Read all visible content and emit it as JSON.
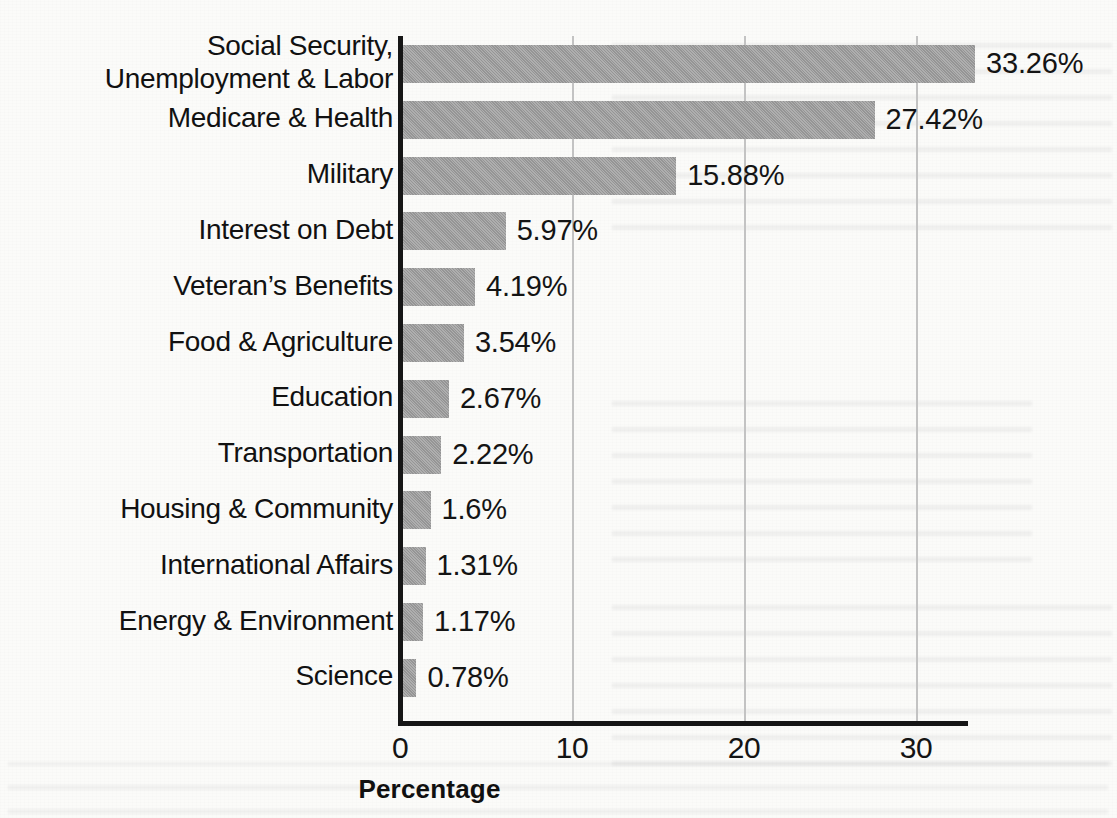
{
  "chart_data": {
    "type": "bar",
    "orientation": "horizontal",
    "title": "",
    "xlabel": "Percentage",
    "ylabel": "",
    "xlim": [
      0,
      33.26
    ],
    "xticks": [
      "0",
      "10",
      "20",
      "30"
    ],
    "xtick_values": [
      0,
      10,
      20,
      30
    ],
    "grid": "vertical gridlines at x ticks",
    "legend": "none",
    "bar_color": "#9d9d9d",
    "axis_color": "#161616",
    "gridline_color": "#c3c3c3",
    "value_suffix": "%",
    "categories": [
      "Social Security,\nUnemployment & Labor",
      "Medicare & Health",
      "Military",
      "Interest on Debt",
      "Veteran’s Benefits",
      "Food & Agriculture",
      "Education",
      "Transportation",
      "Housing & Community",
      "International Affairs",
      "Energy & Environment",
      "Science"
    ],
    "values": [
      33.26,
      27.42,
      15.88,
      5.97,
      4.19,
      3.54,
      2.67,
      2.22,
      1.6,
      1.31,
      1.17,
      0.78
    ],
    "value_labels": [
      "33.26%",
      "27.42%",
      "15.88%",
      "5.97%",
      "4.19%",
      "3.54%",
      "2.67%",
      "2.22%",
      "1.6%",
      "1.31%",
      "1.17%",
      "0.78%"
    ]
  }
}
